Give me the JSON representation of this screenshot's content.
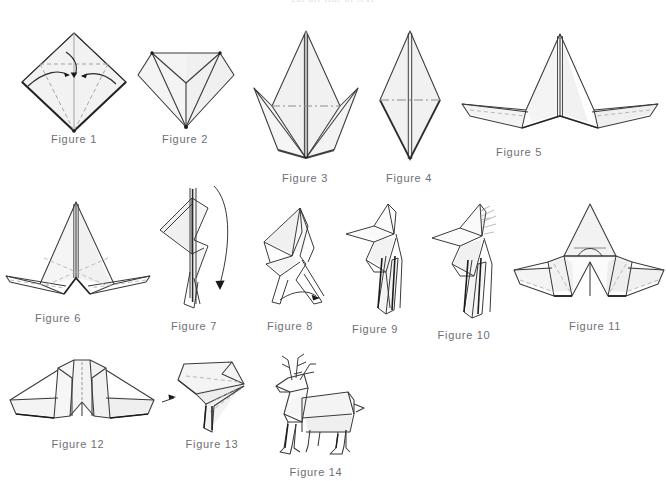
{
  "page": {
    "background_color": "#ffffff",
    "top_bleed_text": "cut off line of text",
    "paper_fill": "#f2f2f2",
    "paper_fill_alt": "#e9e9ea",
    "line_color": "#3a3a3a",
    "fold_line_color": "#b8b8bd",
    "caption_color": "#6e6e76"
  },
  "figures": [
    {
      "id": 1,
      "caption": "Figure 1",
      "caption_x": 74,
      "caption_y": 133,
      "description": "Square base diamond with dashed valley fold lines and three curved arrows folding edges to the center line",
      "arrows": 3,
      "dashed_folds": 4
    },
    {
      "id": 2,
      "caption": "Figure 2",
      "caption_x": 185,
      "caption_y": 133,
      "description": "Kite form with upper corners folded down forming a V shaped flap",
      "arrows": 0,
      "dashed_folds": 0
    },
    {
      "id": 3,
      "caption": "Figure 3",
      "caption_x": 305,
      "caption_y": 172,
      "description": "Tall narrow petal fold point over a wide diamond, horizontal fold line across the middle",
      "arrows": 0,
      "dashed_folds": 1
    },
    {
      "id": 4,
      "caption": "Figure 4",
      "caption_x": 409,
      "caption_y": 172,
      "description": "Slim elongated diamond with horizontal crease at the widest point",
      "arrows": 0,
      "dashed_folds": 1
    },
    {
      "id": 5,
      "caption": "Figure 5",
      "caption_x": 519,
      "caption_y": 146,
      "description": "Central peak standing up with two flat wings spread left and right, dashed creases on wings",
      "arrows": 0,
      "dashed_folds": 2
    },
    {
      "id": 6,
      "caption": "Figure 6",
      "caption_x": 58,
      "caption_y": 312,
      "description": "Tall triangular body with crossing dashed creases and two thin legs spread sideways",
      "arrows": 0,
      "dashed_folds": 4
    },
    {
      "id": 7,
      "caption": "Figure 7",
      "caption_x": 194,
      "caption_y": 320,
      "description": "Side view of folded model with a long curved arrow sweeping down on the right",
      "arrows": 1,
      "dashed_folds": 0
    },
    {
      "id": 8,
      "caption": "Figure 8",
      "caption_x": 290,
      "caption_y": 320,
      "description": "Angular side profile beginning to form body and legs, small curved arrow at lower leg",
      "arrows": 1,
      "dashed_folds": 0
    },
    {
      "id": 9,
      "caption": "Figure 9",
      "caption_x": 375,
      "caption_y": 323,
      "description": "Side profile with pointed head and neck formed, layered legs below",
      "arrows": 0,
      "dashed_folds": 0
    },
    {
      "id": 10,
      "caption": "Figure 10",
      "caption_x": 464,
      "caption_y": 329,
      "description": "Head and neck with hatched shading marks indicating antler area, body and legs below",
      "arrows": 0,
      "dashed_folds": 0
    },
    {
      "id": 11,
      "caption": "Figure 11",
      "caption_x": 595,
      "caption_y": 320,
      "description": "Front view with central peak, two side wings and inner reverse fold arch at center",
      "arrows": 0,
      "dashed_folds": 3
    },
    {
      "id": 12,
      "caption": "Figure 12",
      "caption_x": 78,
      "caption_y": 438,
      "description": "Front view symmetrical form with narrow crimped center panel and wide swept wings",
      "arrows": 0,
      "dashed_folds": 2
    },
    {
      "id": 13,
      "caption": "Figure 13",
      "caption_x": 212,
      "caption_y": 438,
      "description": "Close up of head and neck bent at an angle with dashed shaping creases",
      "arrows": 1,
      "dashed_folds": 3
    },
    {
      "id": 14,
      "caption": "Figure 14",
      "caption_x": 316,
      "caption_y": 466,
      "description": "Completed origami reindeer standing in profile with branched antlers, head, body, tail and four legs",
      "arrows": 0,
      "dashed_folds": 0
    }
  ]
}
